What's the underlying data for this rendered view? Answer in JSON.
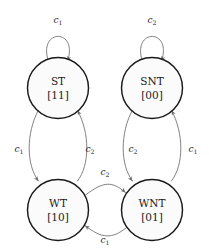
{
  "diagram": {
    "type": "finite-state-machine",
    "background_color": "#ffffff",
    "node_fill_color": "#fbfbfb",
    "node_stroke_color": "#1a1a1a",
    "edge_color": "#6b6b6b",
    "label_color": "#2a2a2a",
    "nodes": [
      {
        "id": "ST",
        "name": "ST",
        "encoding": "[11]",
        "cx": 58,
        "cy": 88,
        "r": 30.5
      },
      {
        "id": "SNT",
        "name": "SNT",
        "encoding": "[00]",
        "cx": 152,
        "cy": 88,
        "r": 30.5
      },
      {
        "id": "WT",
        "name": "WT",
        "encoding": "[10]",
        "cx": 58,
        "cy": 210,
        "r": 30.5
      },
      {
        "id": "WNT",
        "name": "WNT",
        "encoding": "[01]",
        "cx": 152,
        "cy": 210,
        "r": 30.5
      }
    ],
    "edges": [
      {
        "id": "st-self",
        "from": "ST",
        "to": "ST",
        "kind": "self-loop",
        "label_base": "c",
        "label_sub": "1",
        "label_x": 58,
        "label_y": 20
      },
      {
        "id": "snt-self",
        "from": "SNT",
        "to": "SNT",
        "kind": "self-loop",
        "label_base": "c",
        "label_sub": "2",
        "label_x": 152,
        "label_y": 20
      },
      {
        "id": "st-to-wt",
        "from": "ST",
        "to": "WT",
        "kind": "curve",
        "label_base": "c",
        "label_sub": "1",
        "label_x": 19,
        "label_y": 149
      },
      {
        "id": "wt-to-st",
        "from": "WT",
        "to": "ST",
        "kind": "curve",
        "label_base": "c",
        "label_sub": "2",
        "label_x": 90,
        "label_y": 149
      },
      {
        "id": "snt-to-wnt",
        "from": "SNT",
        "to": "WNT",
        "kind": "curve",
        "label_base": "c",
        "label_sub": "2",
        "label_x": 133,
        "label_y": 149
      },
      {
        "id": "wnt-to-snt",
        "from": "WNT",
        "to": "SNT",
        "kind": "curve",
        "label_base": "c",
        "label_sub": "1",
        "label_x": 193,
        "label_y": 149
      },
      {
        "id": "wt-to-wnt",
        "from": "WT",
        "to": "WNT",
        "kind": "curve",
        "label_base": "c",
        "label_sub": "2",
        "label_x": 105,
        "label_y": 172
      },
      {
        "id": "wnt-to-wt",
        "from": "WNT",
        "to": "WT",
        "kind": "curve",
        "label_base": "c",
        "label_sub": "1",
        "label_x": 105,
        "label_y": 240
      }
    ]
  }
}
